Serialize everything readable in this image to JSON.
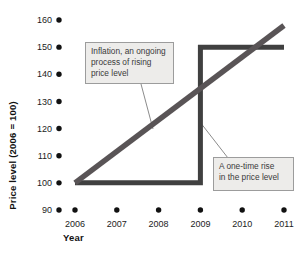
{
  "chart_data": {
    "type": "line",
    "title": "",
    "xlabel": "Year",
    "ylabel": "Price level (2006 = 100)",
    "xlim": [
      2006,
      2011
    ],
    "ylim": [
      90,
      160
    ],
    "x_ticks": [
      2006,
      2007,
      2008,
      2009,
      2010,
      2011
    ],
    "y_ticks": [
      90,
      100,
      110,
      120,
      130,
      140,
      150,
      160
    ],
    "grid": false,
    "tick_marker": "filled black dot",
    "legend": "none",
    "series": [
      {
        "name": "one-time-rise",
        "label": "A one-time rise in the price level",
        "points": [
          [
            2006,
            100
          ],
          [
            2009,
            100
          ],
          [
            2009,
            150
          ],
          [
            2011,
            150
          ]
        ],
        "color": "#404040",
        "stroke_width": 5
      },
      {
        "name": "inflation",
        "label": "Inflation, an ongoing process of rising price level",
        "points": [
          [
            2006,
            100
          ],
          [
            2011,
            158
          ]
        ],
        "color": "#595456",
        "stroke_width": 5.5
      }
    ],
    "annotations": [
      {
        "id": "inflation-note",
        "text": "Inflation, an ongoing\nprocess of rising\nprice level",
        "box": {
          "left": 85,
          "top": 42,
          "width": 89,
          "height": 42
        },
        "leader": {
          "x1": 141,
          "y1": 84,
          "x2": 153,
          "y2": 129
        }
      },
      {
        "id": "one-time-note",
        "text": "A one-time rise\nin the price level",
        "box": {
          "left": 213,
          "top": 157,
          "width": 81,
          "height": 34
        },
        "leader": {
          "x1": 200,
          "y1": 122,
          "x2": 228,
          "y2": 158
        }
      }
    ],
    "colors": {
      "background": "#ffffff",
      "tick_dot": "#111111",
      "tick_text": "#1c1c1c",
      "annotation_bg": "#edecea",
      "annotation_border": "#9c9c9c",
      "leader_line": "#8c8c8c"
    }
  }
}
